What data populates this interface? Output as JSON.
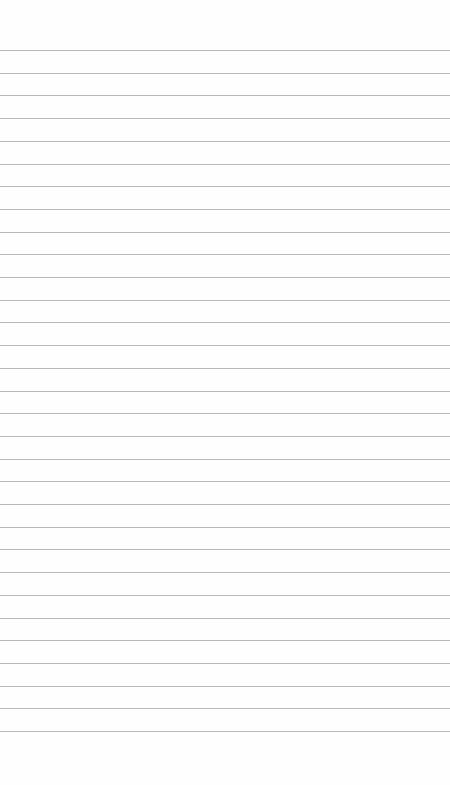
{
  "paper": {
    "background": "#fefefe",
    "line_color": "#b9b9b9",
    "first_line_y": 50,
    "line_spacing": 22.7,
    "line_count": 31
  }
}
